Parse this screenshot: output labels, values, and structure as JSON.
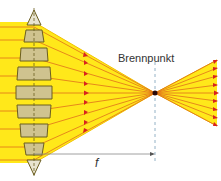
{
  "diagram": {
    "labels": {
      "focal_point": "Brennpunkt",
      "focal_length": "f"
    },
    "colors": {
      "beam": "#ffe81a",
      "beam_edge": "#f2c200",
      "ray": "#e0701a",
      "arrow": "#d8231f",
      "prism_fill": "#cfc38f",
      "prism_stroke": "#6b5e20",
      "focus_dot": "#2a0a0a",
      "axis_dash": "#7aa0b8",
      "dimension_line": "#888888"
    },
    "lens": {
      "center_x": 34,
      "prism_count": 7
    },
    "focal_point": {
      "x": 155,
      "y": 93
    },
    "rays": 9
  }
}
